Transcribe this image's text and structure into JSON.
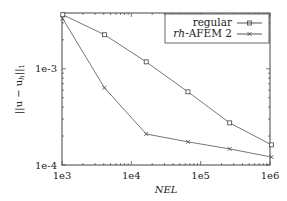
{
  "chart_data": {
    "type": "line",
    "title": "",
    "xlabel": "NEL",
    "ylabel": "||u - u_h||_1",
    "xscale": "log",
    "yscale": "log",
    "xlim": [
      1000,
      1000000
    ],
    "ylim": [
      0.0001,
      0.0038
    ],
    "grid": false,
    "legend_position": "upper right",
    "x_ticks": [
      {
        "value": 1000,
        "label": "1e3"
      },
      {
        "value": 10000,
        "label": "1e4"
      },
      {
        "value": 100000,
        "label": "1e5"
      },
      {
        "value": 1000000,
        "label": "1e6"
      }
    ],
    "y_ticks": [
      {
        "value": 0.001,
        "label": "1e-3"
      },
      {
        "value": 0.0001,
        "label": "1e-4"
      }
    ],
    "x": [
      1024,
      4096,
      16384,
      65536,
      262144,
      1048576
    ],
    "series": [
      {
        "name": "regular",
        "marker": "square",
        "values": [
          0.00365,
          0.00226,
          0.00118,
          0.000576,
          0.000274,
          0.000162
        ]
      },
      {
        "name": "rh-AFEM 2",
        "marker": "cross",
        "values": [
          0.00332,
          0.000634,
          0.00021,
          0.000174,
          0.000147,
          0.000121
        ]
      }
    ]
  },
  "labels": {
    "ylabel_main": "||u − u",
    "ylabel_sub": "h",
    "ylabel_tail": "||",
    "ylabel_tail_sub": "1",
    "xlabel": "NEL",
    "legend_regular": "regular",
    "legend_rh_italic": "rh",
    "legend_rh_rest": "-AFEM 2"
  }
}
